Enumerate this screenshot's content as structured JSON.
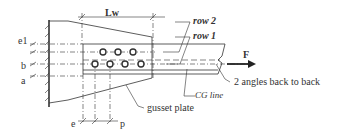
{
  "diagram": {
    "type": "bolted gusset plate connection with double angle",
    "labels": {
      "lw": "Lw",
      "row2": "row 2",
      "row1": "row 1",
      "force": "F",
      "angles": "2 angles back to back",
      "cg_line": "CG line",
      "gusset": "gusset plate",
      "e1": "e1",
      "b": "b",
      "a": "a",
      "e": "e",
      "p": "p"
    },
    "bolts": {
      "row2_count": 3,
      "row1_count": 4
    },
    "colors": {
      "line": "#333333",
      "background": "#ffffff"
    }
  }
}
